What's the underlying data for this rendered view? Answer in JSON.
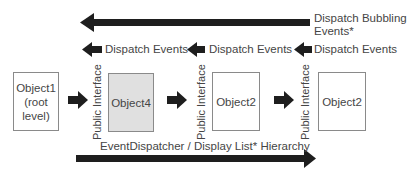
{
  "diagram": {
    "bubbling_label_line1": "Dispatch Bubbling",
    "bubbling_label_line2": "Events*",
    "dispatch_labels": [
      "Dispatch Events",
      "Dispatch Events",
      "Dispatch Events"
    ],
    "objects": [
      {
        "line1": "Object1",
        "line2": "(root",
        "line3": "level)",
        "highlighted": false
      },
      {
        "line1": "Object4",
        "highlighted": true
      },
      {
        "line1": "Object2",
        "highlighted": false
      },
      {
        "line1": "Object2",
        "highlighted": false
      }
    ],
    "interface_labels": [
      "Public Interface",
      "Public Interface",
      "Public Interface"
    ],
    "hierarchy_label": "EventDispatcher / Display List* Hierarchy",
    "colors": {
      "arrow": "#1e1e1e",
      "box_border": "#8a8a8a",
      "highlight_fill": "#e0e0e0",
      "text": "#454545"
    }
  }
}
